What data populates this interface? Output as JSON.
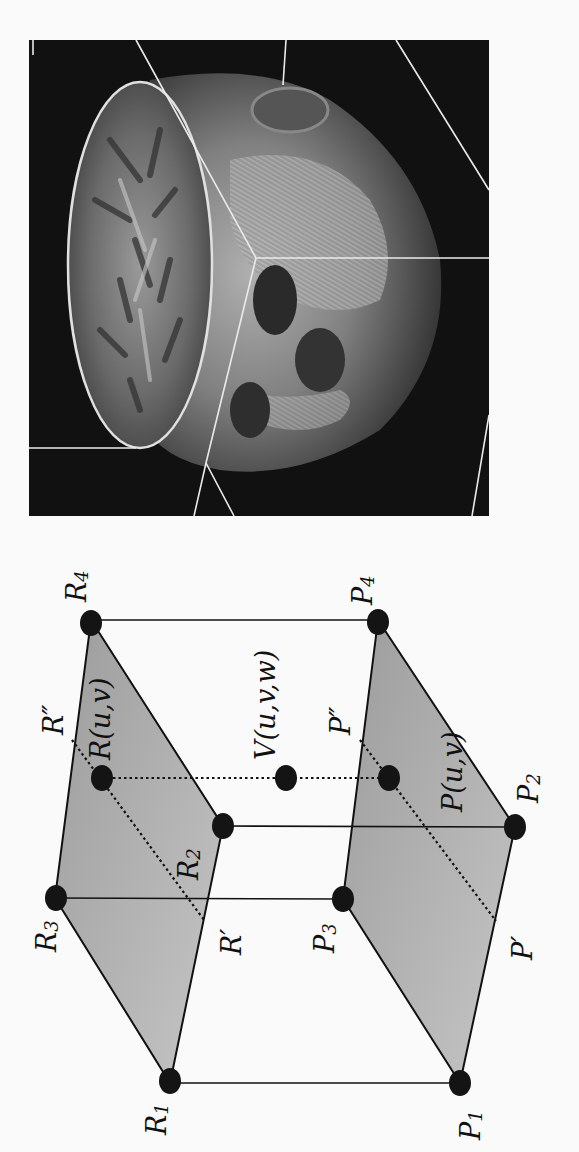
{
  "figure": {
    "orientation": "rotated-90-ccw",
    "colors": {
      "background": "#fafafa",
      "plane_fill": "#a8a8a8",
      "plane_fill_light": "#c4c4c4",
      "line": "#111111",
      "vertex": "#141414",
      "mri_background": "#111111",
      "mri_outline": "#e8e8e8"
    }
  },
  "mri_panel": {
    "description": "3D MRI head volume rendering with cut-away showing brain slice",
    "box": {
      "x": 29,
      "y": 40,
      "width": 460,
      "height": 476
    }
  },
  "diagram": {
    "top_plane_labels": {
      "r1": {
        "base": "R",
        "sub": "1"
      },
      "r2": {
        "base": "R",
        "sub": "2"
      },
      "r3": {
        "base": "R",
        "sub": "3"
      },
      "r4": {
        "base": "R",
        "sub": "4"
      },
      "r_prime": "R′",
      "r_double_prime": "R″",
      "r_uv": "R(u,v)"
    },
    "bottom_plane_labels": {
      "p1": {
        "base": "P",
        "sub": "1"
      },
      "p2": {
        "base": "P",
        "sub": "2"
      },
      "p3": {
        "base": "P",
        "sub": "3"
      },
      "p4": {
        "base": "P",
        "sub": "4"
      },
      "p_prime": "P′",
      "p_double_prime": "P″",
      "p_uv": "P(u,v)"
    },
    "center_label": "V(u,v,w)"
  }
}
